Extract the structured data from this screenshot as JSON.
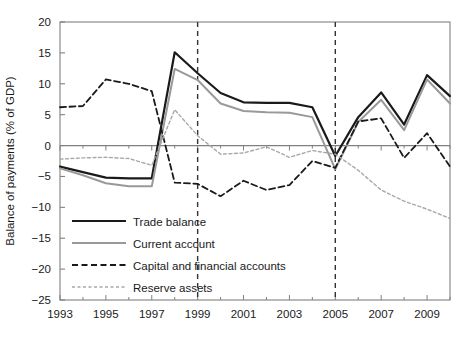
{
  "chart_data": {
    "type": "line",
    "title": "",
    "xlabel": "",
    "ylabel": "Balance of payments (% of GDP)",
    "ylim": [
      -25,
      20
    ],
    "xlim": [
      1993,
      2010
    ],
    "ytick_labels": [
      "20",
      "15",
      "10",
      "5",
      "0",
      "−5",
      "−10",
      "−15",
      "−20",
      "−25"
    ],
    "ytick_values": [
      20,
      15,
      10,
      5,
      0,
      -5,
      -10,
      -15,
      -20,
      -25
    ],
    "xtick_labels": [
      "1993",
      "1995",
      "1997",
      "1999",
      "2001",
      "2003",
      "2005",
      "2007",
      "2009"
    ],
    "xtick_values": [
      1993,
      1995,
      1997,
      1999,
      2001,
      2003,
      2005,
      2007,
      2009
    ],
    "minor_xticks": [
      1994,
      1996,
      1998,
      2000,
      2002,
      2004,
      2006,
      2008,
      2010
    ],
    "grid": false,
    "legend_position": "lower-left",
    "x": [
      1993,
      1994,
      1995,
      1996,
      1997,
      1998,
      1999,
      2000,
      2001,
      2002,
      2003,
      2004,
      2005,
      2006,
      2007,
      2008,
      2009,
      2010
    ],
    "annotations": [
      {
        "name": "vertical-reference-line-1999",
        "x": 1999,
        "style": "dashed"
      },
      {
        "name": "vertical-reference-line-2005",
        "x": 2005,
        "style": "dashed"
      }
    ],
    "series": [
      {
        "name": "Trade balance",
        "color": "#1a1a1a",
        "style": "solid",
        "width": 2.2,
        "values": [
          -3.4,
          -4.3,
          -5.2,
          -5.3,
          -5.3,
          -1.3,
          15.1,
          11.7,
          8.5,
          7.3,
          6.9,
          6.9,
          6.2,
          3.4,
          -1.7,
          4.6,
          4.6,
          1.9
        ]
      },
      {
        "name": "Current account",
        "color": "#999999",
        "style": "solid",
        "width": 2.0,
        "values": [
          -3.7,
          -4.8,
          -6.1,
          -6.6,
          -6.6,
          -2.3,
          12.4,
          11.0,
          7.3,
          5.5,
          4.8,
          4.6,
          3.6,
          1.3,
          -3.8,
          3.8,
          3.8,
          0.6
        ]
      },
      {
        "name": "Capital and financial accounts",
        "color": "#1a1a1a",
        "style": "dashed",
        "width": 1.8,
        "values": [
          6.2,
          6.4,
          10.7,
          10.3,
          8.8,
          -0.4,
          -6.0,
          -6.2,
          -8.2,
          -5.6,
          -6.4,
          -3.8,
          -1.7,
          -2.8,
          -0.1,
          2.2,
          3.2,
          4.6
        ]
      },
      {
        "name": "Reserve assets",
        "color": "#a8a8a8",
        "style": "fine-dashed",
        "width": 1.4,
        "values": [
          -2.2,
          -1.9,
          -1.9,
          -2.9,
          -4.2,
          5.8,
          1.6,
          -1.4,
          -1.2,
          0.0,
          -1.0,
          -2.0,
          -1.0,
          1.1,
          -0.8,
          0.5,
          -0.6,
          2.3
        ]
      }
    ],
    "series_points": {
      "Trade balance": [
        [
          1993,
          -3.4
        ],
        [
          1994,
          -4.3
        ],
        [
          1995,
          -5.2
        ],
        [
          1996,
          -5.3
        ],
        [
          1997,
          -5.3
        ],
        [
          1998,
          15.1
        ],
        [
          1999,
          11.7
        ],
        [
          2000,
          8.5
        ],
        [
          2001,
          7.0
        ],
        [
          2002,
          6.9
        ],
        [
          2003,
          6.9
        ],
        [
          2004,
          6.2
        ],
        [
          2005,
          -1.7
        ],
        [
          2006,
          4.6
        ],
        [
          2007,
          8.6
        ],
        [
          2008,
          3.4
        ],
        [
          2009,
          11.4
        ],
        [
          2010,
          8.0
        ]
      ],
      "Current account": [
        [
          1993,
          -3.7
        ],
        [
          1994,
          -4.8
        ],
        [
          1995,
          -6.1
        ],
        [
          1996,
          -6.6
        ],
        [
          1997,
          -6.6
        ],
        [
          1998,
          12.4
        ],
        [
          1999,
          10.6
        ],
        [
          2000,
          6.8
        ],
        [
          2001,
          5.6
        ],
        [
          2002,
          5.4
        ],
        [
          2003,
          5.3
        ],
        [
          2004,
          4.6
        ],
        [
          2005,
          -3.8
        ],
        [
          2006,
          3.8
        ],
        [
          2007,
          7.4
        ],
        [
          2008,
          2.5
        ],
        [
          2009,
          10.7
        ],
        [
          2010,
          6.8
        ]
      ],
      "Capital and financial accounts": [
        [
          1993,
          6.2
        ],
        [
          1994,
          6.4
        ],
        [
          1995,
          10.7
        ],
        [
          1996,
          10.0
        ],
        [
          1997,
          8.8
        ],
        [
          1998,
          -6.0
        ],
        [
          1999,
          -6.2
        ],
        [
          2000,
          -8.2
        ],
        [
          2001,
          -5.7
        ],
        [
          2002,
          -7.2
        ],
        [
          2003,
          -6.4
        ],
        [
          2004,
          -2.5
        ],
        [
          2005,
          -3.6
        ],
        [
          2006,
          3.9
        ],
        [
          2007,
          4.4
        ],
        [
          2008,
          -2.0
        ],
        [
          2009,
          2.0
        ],
        [
          2010,
          -3.4
        ]
      ],
      "Reserve assets": [
        [
          1993,
          -2.2
        ],
        [
          1994,
          -2.0
        ],
        [
          1995,
          -1.9
        ],
        [
          1996,
          -2.1
        ],
        [
          1997,
          -3.2
        ],
        [
          1998,
          5.8
        ],
        [
          1999,
          1.6
        ],
        [
          2000,
          -1.4
        ],
        [
          2001,
          -1.2
        ],
        [
          2002,
          -0.2
        ],
        [
          2003,
          -1.9
        ],
        [
          2004,
          -0.8
        ],
        [
          2005,
          -1.4
        ],
        [
          2006,
          -4.0
        ],
        [
          2007,
          -7.2
        ],
        [
          2008,
          -9.0
        ],
        [
          2009,
          -10.3
        ],
        [
          2010,
          -11.8
        ]
      ]
    }
  },
  "legend": {
    "items": [
      {
        "label": "Trade balance",
        "swatch": "solid-black-thick"
      },
      {
        "label": "Current account",
        "swatch": "solid-gray"
      },
      {
        "label": "Capital and financial accounts",
        "swatch": "dashed-black"
      },
      {
        "label": "Reserve assets",
        "swatch": "fine-dashed-gray"
      }
    ]
  },
  "axes": {
    "y_title": "Balance of payments (% of GDP)"
  },
  "colors": {
    "trade_balance": "#1a1a1a",
    "current_account": "#999999",
    "capital_financial": "#1a1a1a",
    "reserve_assets": "#a8a8a8",
    "axis": "#808080",
    "text": "#1a1a1a"
  }
}
